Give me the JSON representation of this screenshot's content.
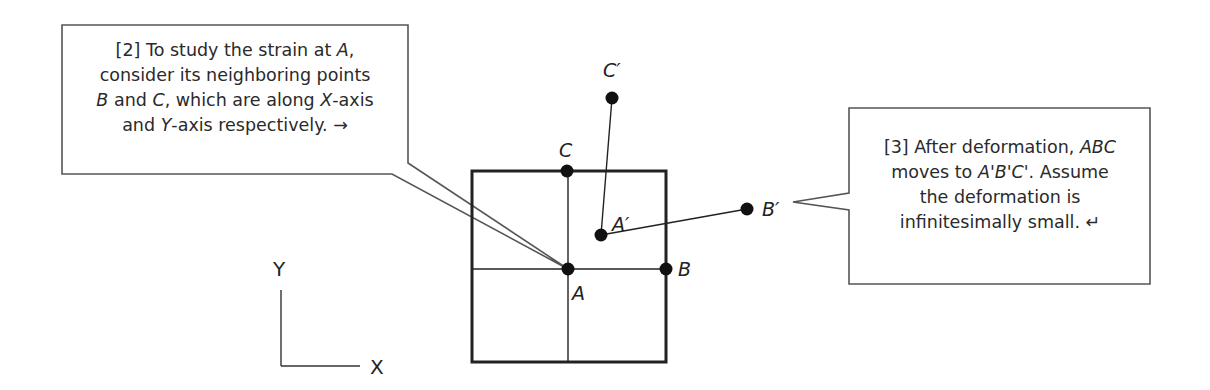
{
  "callouts": {
    "left": {
      "number": "[2]",
      "lines": [
        [
          "[2] To study the strain at ",
          {
            "i": "A"
          },
          ","
        ],
        [
          "consider its neighboring points"
        ],
        [
          {
            "i": "B"
          },
          " and ",
          {
            "i": "C"
          },
          ", which are along ",
          {
            "i": "X"
          },
          "-axis"
        ],
        [
          "and ",
          {
            "i": "Y"
          },
          "-axis respectively. ",
          "→"
        ]
      ],
      "plain_text": "[2] To study the strain at A, consider its neighboring points B and C, which are along X-axis and Y-axis respectively. →"
    },
    "right": {
      "number": "[3]",
      "lines": [
        [
          "[3] After deformation, ",
          {
            "i": "ABC"
          }
        ],
        [
          "moves to ",
          {
            "i": "A'B'C'"
          },
          ". Assume"
        ],
        [
          "the deformation is"
        ],
        [
          "infinitesimally small.  ",
          "↵"
        ]
      ],
      "plain_text": "[3] After deformation, ABC moves to A'B'C'. Assume the deformation is infinitesimally small. ↵"
    }
  },
  "points": {
    "A": {
      "label": "A",
      "x": 568,
      "y": 269
    },
    "B": {
      "label": "B",
      "x": 666,
      "y": 269
    },
    "C": {
      "label": "C",
      "x": 567,
      "y": 171
    },
    "A_prime": {
      "label": "A′",
      "x": 601,
      "y": 235
    },
    "B_prime": {
      "label": "B′",
      "x": 747,
      "y": 209
    },
    "C_prime": {
      "label": "C′",
      "x": 612,
      "y": 98
    }
  },
  "axes": {
    "x_label": "X",
    "y_label": "Y"
  },
  "colors": {
    "ink": "#222222",
    "callout_border": "#555555",
    "background": "#ffffff"
  }
}
